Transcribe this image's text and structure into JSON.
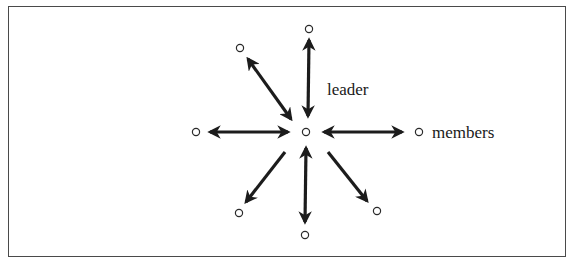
{
  "diagram": {
    "type": "communication-network",
    "pattern": "wheel",
    "colors": {
      "frame": "#4a4a4a",
      "arrow": "#1c1c1c",
      "node_stroke": "#2a2a2a",
      "text": "#1a1a1a",
      "background": "#ffffff"
    },
    "labels": {
      "leader": "leader",
      "members": "members"
    },
    "center_node": {
      "id": "leader",
      "x": 306,
      "y": 132,
      "role": "leader"
    },
    "member_nodes": [
      {
        "id": "top",
        "x": 309,
        "y": 29
      },
      {
        "id": "top-left",
        "x": 240,
        "y": 48
      },
      {
        "id": "left",
        "x": 196,
        "y": 132
      },
      {
        "id": "right",
        "x": 419,
        "y": 132
      },
      {
        "id": "bottom-left",
        "x": 239,
        "y": 213
      },
      {
        "id": "bottom",
        "x": 305,
        "y": 235
      },
      {
        "id": "bottom-right",
        "x": 377,
        "y": 211
      }
    ],
    "edges": [
      {
        "from": "leader",
        "to": "top",
        "direction": "both"
      },
      {
        "from": "leader",
        "to": "top-left",
        "direction": "both"
      },
      {
        "from": "leader",
        "to": "left",
        "direction": "both"
      },
      {
        "from": "leader",
        "to": "right",
        "direction": "both"
      },
      {
        "from": "leader",
        "to": "bottom-left",
        "direction": "outward"
      },
      {
        "from": "leader",
        "to": "bottom",
        "direction": "both"
      },
      {
        "from": "leader",
        "to": "bottom-right",
        "direction": "outward"
      }
    ]
  }
}
